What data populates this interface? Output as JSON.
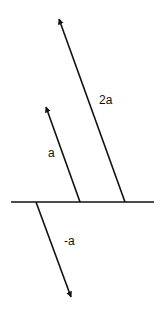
{
  "diagram": {
    "stroke_color": "#111111",
    "background": "#ffffff",
    "baseline": {
      "x1": 11,
      "y1": 202,
      "x2": 154,
      "y2": 202
    },
    "vectors": [
      {
        "id": "vector-2a",
        "label": "2a",
        "x1": 125,
        "y1": 202,
        "x2": 59,
        "y2": 19,
        "label_x": 99,
        "label_y": 104
      },
      {
        "id": "vector-a",
        "label": "a",
        "x1": 80,
        "y1": 202,
        "x2": 46,
        "y2": 107,
        "label_x": 48,
        "label_y": 157
      },
      {
        "id": "vector-neg-a",
        "label": "-a",
        "x1": 36,
        "y1": 202,
        "x2": 71,
        "y2": 297,
        "label_x": 64,
        "label_y": 245
      }
    ]
  }
}
